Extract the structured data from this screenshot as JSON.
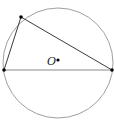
{
  "diagram": {
    "type": "geometry",
    "circle": {
      "cx": 58,
      "cy": 63,
      "r": 55,
      "stroke": "#9a9a9a"
    },
    "center": {
      "label": "O",
      "x": 58,
      "y": 60
    },
    "points": [
      {
        "name": "top-left-vertex",
        "x": 21,
        "y": 17
      },
      {
        "name": "left-vertex",
        "x": 4,
        "y": 70
      },
      {
        "name": "right-vertex",
        "x": 112,
        "y": 70
      }
    ],
    "segments": [
      {
        "from": 0,
        "to": 1
      },
      {
        "from": 0,
        "to": 2
      },
      {
        "from": 1,
        "to": 2
      }
    ],
    "colors": {
      "line": "#3a3a3a",
      "chord": "#8a8a8a",
      "point": "#000000"
    }
  }
}
